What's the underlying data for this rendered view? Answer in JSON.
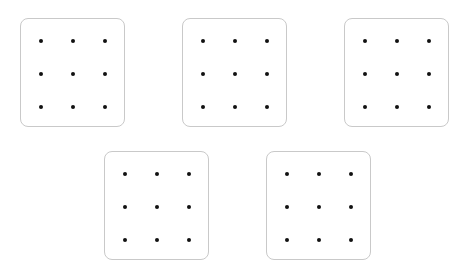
{
  "diagram": {
    "panel_size": {
      "width": 105,
      "height": 109
    },
    "border_color": "#c9c9c9",
    "dot_color": "#111111",
    "dot_offsets_x": [
      21,
      53,
      85
    ],
    "dot_offsets_y": [
      23,
      56,
      89
    ],
    "panels": [
      {
        "id": "panel-1",
        "x": 20,
        "y": 18,
        "rows": 3,
        "cols": 3
      },
      {
        "id": "panel-2",
        "x": 182,
        "y": 18,
        "rows": 3,
        "cols": 3
      },
      {
        "id": "panel-3",
        "x": 344,
        "y": 18,
        "rows": 3,
        "cols": 3
      },
      {
        "id": "panel-4",
        "x": 104,
        "y": 151,
        "rows": 3,
        "cols": 3
      },
      {
        "id": "panel-5",
        "x": 266,
        "y": 151,
        "rows": 3,
        "cols": 3
      }
    ]
  }
}
